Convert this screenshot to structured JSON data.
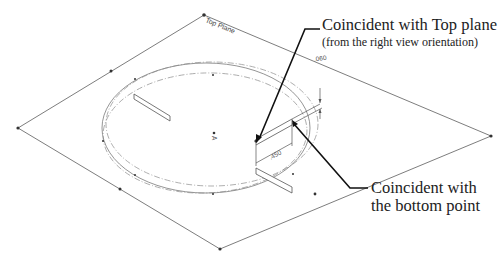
{
  "diagram": {
    "plane_label": "Top Plane",
    "dimensions": {
      "offset": ".060",
      "length": ".450"
    },
    "origin_label": "A",
    "callouts": [
      {
        "id": "top",
        "title": "Coincident with Top plane",
        "subtitle": "(from the right view orientation)"
      },
      {
        "id": "bottom",
        "line1": "Coincident with",
        "line2": "the bottom point"
      }
    ],
    "colors": {
      "plane_edge": "#6e6e6e",
      "leader": "#111111",
      "text": "#222222"
    }
  }
}
